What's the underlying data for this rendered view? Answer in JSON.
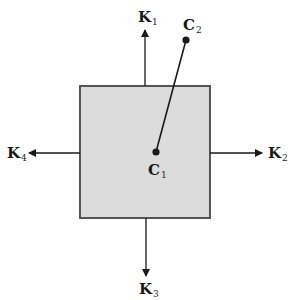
{
  "diagram": {
    "colors": {
      "box_fill": "#dcdcdc",
      "box_stroke": "#555555",
      "line": "#1a1a1a",
      "background": "#ffffff"
    },
    "box": {
      "x": 80,
      "y": 86,
      "width": 130,
      "height": 132
    },
    "points": {
      "C1": {
        "label": "C",
        "sub": "1",
        "x": 156,
        "y": 152
      },
      "C2": {
        "label": "C",
        "sub": "2",
        "x": 186,
        "y": 40
      }
    },
    "forces": [
      {
        "id": "K1",
        "label": "K",
        "sub": "1",
        "direction": "up"
      },
      {
        "id": "K2",
        "label": "K",
        "sub": "2",
        "direction": "right"
      },
      {
        "id": "K3",
        "label": "K",
        "sub": "3",
        "direction": "down"
      },
      {
        "id": "K4",
        "label": "K",
        "sub": "4",
        "direction": "left"
      }
    ]
  }
}
